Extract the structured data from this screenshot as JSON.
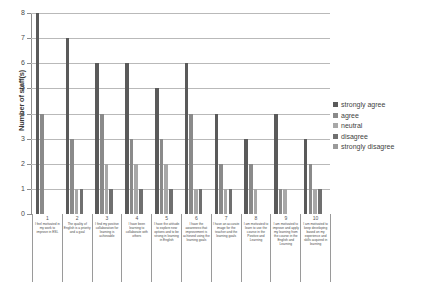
{
  "chart_data": {
    "type": "bar",
    "title": "",
    "xlabel": "",
    "ylabel": "Number of staff(s)",
    "ylim": [
      0,
      8
    ],
    "yticks": [
      "0",
      "1",
      "2",
      "3",
      "4",
      "5",
      "6",
      "7",
      "8"
    ],
    "grid": true,
    "legend_position": "right",
    "categories": [
      "1",
      "2",
      "3",
      "4",
      "5",
      "6",
      "7",
      "8",
      "9",
      "10"
    ],
    "category_labels": [
      "I feel motivated in my work to improve in ESL",
      "The quality of English is a priority and a goal",
      "I find my positive collaboration for learning is achievable",
      "I have been learning to collaborate with others",
      "I have the attitude to explore new options and to be strong in learning in English",
      "I have the awareness that improvement is achieved using the learning goals",
      "I have an accurate image for the teacher and the learning goals",
      "I am motivated to learn to use the course in the Positive and Learning",
      "I am motivated to improve and apply my learning from the course in the English and Learning",
      "I am motivated to keep developing based on my experience and skills acquired in learning"
    ],
    "series": [
      {
        "name": "strongly agree",
        "color": "#5a5a5a",
        "values": [
          8,
          7,
          6,
          6,
          5,
          6,
          4,
          3,
          4,
          3
        ]
      },
      {
        "name": "agree",
        "color": "#8a8a8a",
        "values": [
          4,
          3,
          4,
          3,
          3,
          4,
          2,
          2,
          1,
          2
        ]
      },
      {
        "name": "neutral",
        "color": "#a8a8a8",
        "values": [
          0,
          1,
          2,
          2,
          2,
          1,
          1,
          1,
          1,
          1
        ]
      },
      {
        "name": "disagree",
        "color": "#707070",
        "values": [
          0,
          1,
          1,
          1,
          1,
          1,
          1,
          0,
          0,
          1
        ]
      },
      {
        "name": "strongly disagree",
        "color": "#9a9a9a",
        "values": [
          0,
          0,
          0,
          0,
          0,
          0,
          0,
          0,
          0,
          0
        ]
      }
    ]
  }
}
